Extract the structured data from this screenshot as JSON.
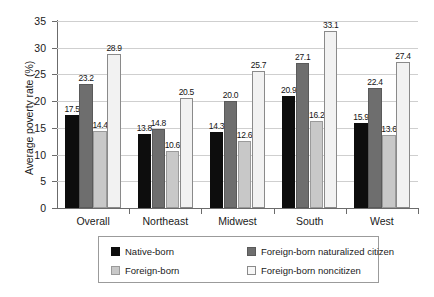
{
  "chart_data": {
    "type": "bar",
    "title": "",
    "xlabel": "",
    "ylabel": "Average poverty rate (%)",
    "ylim": [
      0,
      35
    ],
    "yticks": [
      0,
      5,
      10,
      15,
      20,
      25,
      30,
      35
    ],
    "ytick_labels": [
      "0",
      "5",
      "10",
      "15",
      "20",
      "25",
      "30",
      "35"
    ],
    "grid": true,
    "legend_position": "bottom",
    "categories": [
      "Overall",
      "Northeast",
      "Midwest",
      "South",
      "West"
    ],
    "series": [
      {
        "name": "Native-born",
        "color": "#0d0d0d",
        "values": [
          17.5,
          13.8,
          14.3,
          20.9,
          15.9
        ],
        "labels": [
          "17.5",
          "13.8",
          "14.3",
          "20.9",
          "15.9"
        ]
      },
      {
        "name": "Foreign-born naturalized citizen",
        "color": "#6e6e6e",
        "values": [
          23.2,
          14.8,
          20.0,
          27.1,
          22.4
        ],
        "labels": [
          "23.2",
          "14.8",
          "20.0",
          "27.1",
          "22.4"
        ]
      },
      {
        "name": "Foreign-born",
        "color": "#c8c8c8",
        "values": [
          14.4,
          10.6,
          12.6,
          16.2,
          13.6
        ],
        "labels": [
          "14.4",
          "10.6",
          "12.6",
          "16.2",
          "13.6"
        ]
      },
      {
        "name": "Foreign-born noncitizen",
        "color": "#f2f2f2",
        "values": [
          28.9,
          20.5,
          25.7,
          33.1,
          27.4
        ],
        "labels": [
          "28.9",
          "20.5",
          "25.7",
          "33.1",
          "27.4"
        ]
      }
    ],
    "legend": [
      {
        "label": "Native-born",
        "swatch": "s0"
      },
      {
        "label": "Foreign-born naturalized citizen",
        "swatch": "s1"
      },
      {
        "label": "Foreign-born",
        "swatch": "s2"
      },
      {
        "label": "Foreign-born noncitizen",
        "swatch": "s3"
      }
    ]
  }
}
